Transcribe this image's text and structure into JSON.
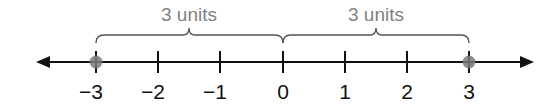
{
  "diagram": {
    "type": "number-line",
    "ticks": [
      {
        "value": -3,
        "label": "−3",
        "x": 96
      },
      {
        "value": -2,
        "label": "−2",
        "x": 158
      },
      {
        "value": -1,
        "label": "−1",
        "x": 220
      },
      {
        "value": 0,
        "label": "0",
        "x": 283
      },
      {
        "value": 1,
        "label": "1",
        "x": 345
      },
      {
        "value": 2,
        "label": "2",
        "x": 407
      },
      {
        "value": 3,
        "label": "3",
        "x": 469
      }
    ],
    "points": [
      -3,
      3
    ],
    "braces": [
      {
        "from": -3,
        "to": 0,
        "label": "3 units"
      },
      {
        "from": 0,
        "to": 3,
        "label": "3 units"
      }
    ],
    "colors": {
      "line": "#111111",
      "point": "#7a7a7a",
      "brace": "#808080"
    }
  }
}
